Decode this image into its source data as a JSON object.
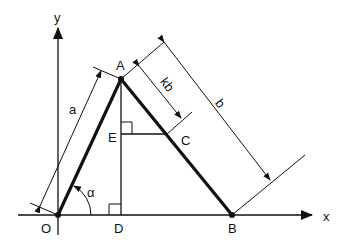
{
  "figure": {
    "type": "geometry-diagram",
    "background": "#ffffff",
    "stroke_color": "#111111"
  },
  "axes": {
    "x_label": "x",
    "y_label": "y"
  },
  "points": {
    "O": {
      "label": "O"
    },
    "A": {
      "label": "A"
    },
    "B": {
      "label": "B"
    },
    "C": {
      "label": "C"
    },
    "D": {
      "label": "D"
    },
    "E": {
      "label": "E"
    }
  },
  "dimensions": {
    "a": "a",
    "b": "b",
    "kb": "kb"
  },
  "angle": {
    "alpha": "α"
  }
}
